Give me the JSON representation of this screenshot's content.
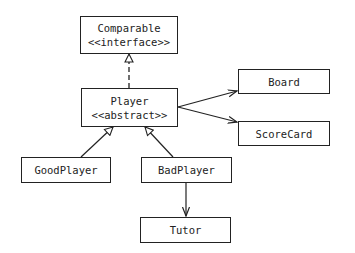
{
  "diagram": {
    "type": "uml-class-diagram",
    "nodes": [
      {
        "id": "comparable",
        "name": "Comparable",
        "stereotype": "<<interface>>"
      },
      {
        "id": "player",
        "name": "Player",
        "stereotype": "<<abstract>>"
      },
      {
        "id": "board",
        "name": "Board"
      },
      {
        "id": "scorecard",
        "name": "ScoreCard"
      },
      {
        "id": "goodplayer",
        "name": "GoodPlayer"
      },
      {
        "id": "badplayer",
        "name": "BadPlayer"
      },
      {
        "id": "tutor",
        "name": "Tutor"
      }
    ],
    "edges": [
      {
        "from": "player",
        "to": "comparable",
        "kind": "realization",
        "style": "dashed",
        "head": "hollow-triangle"
      },
      {
        "from": "player",
        "to": "board",
        "kind": "association",
        "style": "solid",
        "head": "arrow"
      },
      {
        "from": "player",
        "to": "scorecard",
        "kind": "association",
        "style": "solid",
        "head": "arrow"
      },
      {
        "from": "goodplayer",
        "to": "player",
        "kind": "inheritance",
        "style": "solid",
        "head": "hollow-triangle"
      },
      {
        "from": "badplayer",
        "to": "player",
        "kind": "inheritance",
        "style": "solid",
        "head": "hollow-triangle"
      },
      {
        "from": "badplayer",
        "to": "tutor",
        "kind": "association",
        "style": "solid",
        "head": "arrow"
      }
    ]
  },
  "colors": {
    "line": "#222222",
    "background": "#ffffff"
  }
}
